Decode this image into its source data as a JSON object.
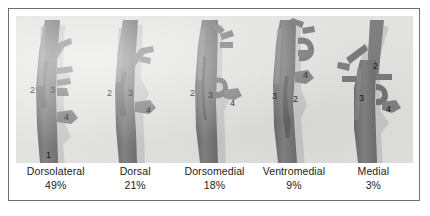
{
  "figure": {
    "kind": "anatomical-variant-diagram",
    "panel_count": 5,
    "segment_legend": {
      "1": "1",
      "2": "2",
      "3": "3",
      "4": "4"
    },
    "colors": {
      "vessel_fill": "#7e7e7e",
      "vessel_shadow": "#5f5f5f",
      "vessel_highlight": "#9a9a9a",
      "panel_background": "#e2e2e0",
      "page_background": "#ffffff",
      "frame_border": "#6e6e6e",
      "label_text": "#1b1b1b"
    }
  },
  "panels": [
    {
      "name": "Dorsolateral",
      "percent": "49%",
      "labels": [
        "2",
        "3",
        "4",
        "1"
      ]
    },
    {
      "name": "Dorsal",
      "percent": "21%",
      "labels": [
        "2",
        "3",
        "4"
      ]
    },
    {
      "name": "Dorsomedial",
      "percent": "18%",
      "labels": [
        "2",
        "3",
        "4"
      ]
    },
    {
      "name": "Ventromedial",
      "percent": "9%",
      "labels": [
        "3",
        "2",
        "4"
      ]
    },
    {
      "name": "Medial",
      "percent": "3%",
      "labels": [
        "2",
        "3",
        "4"
      ]
    }
  ]
}
